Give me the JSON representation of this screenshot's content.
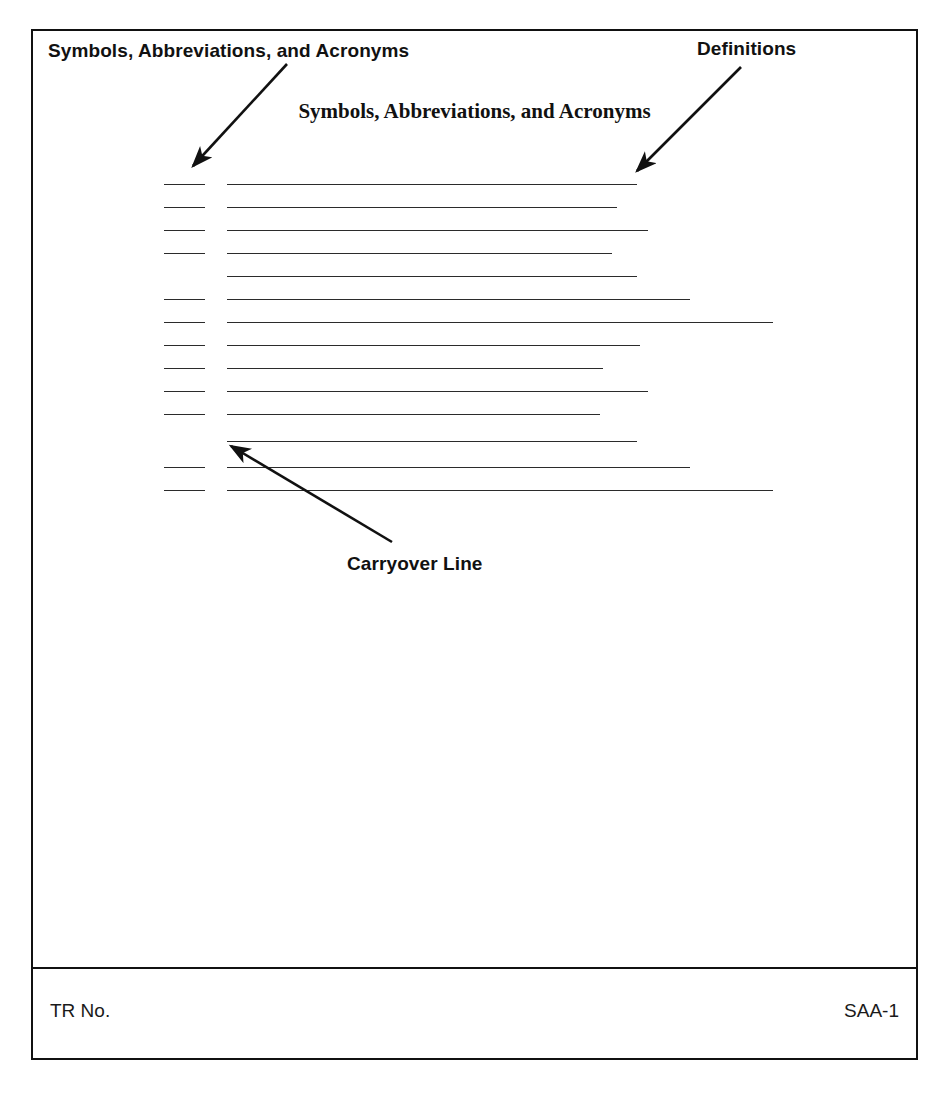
{
  "document": {
    "heading": "Symbols, Abbreviations, and Acronyms",
    "form_id": "SAA-1"
  },
  "callouts": {
    "symbols": {
      "label": "Symbols, Abbreviations, and Acronyms",
      "arrow": {
        "x1": 287,
        "y1": 64,
        "x2": 193,
        "y2": 166
      }
    },
    "definitions": {
      "label": "Definitions",
      "arrow": {
        "x1": 741,
        "y1": 67,
        "x2": 637,
        "y2": 171
      }
    },
    "carryover": {
      "label": "Carryover Line",
      "arrow": {
        "x1": 392,
        "y1": 542,
        "x2": 231,
        "y2": 446
      }
    }
  },
  "form_rows": [
    {
      "type": "entry",
      "y": 184,
      "symbol_x": 164,
      "symbol_x2": 205,
      "def_x": 227,
      "def_x2": 637
    },
    {
      "type": "entry",
      "y": 207,
      "symbol_x": 164,
      "symbol_x2": 205,
      "def_x": 227,
      "def_x2": 617
    },
    {
      "type": "entry",
      "y": 230,
      "symbol_x": 164,
      "symbol_x2": 205,
      "def_x": 227,
      "def_x2": 648
    },
    {
      "type": "entry",
      "y": 253,
      "symbol_x": 164,
      "symbol_x2": 205,
      "def_x": 227,
      "def_x2": 612
    },
    {
      "type": "carryover",
      "y": 276,
      "def_x": 227,
      "def_x2": 637
    },
    {
      "type": "entry",
      "y": 299,
      "symbol_x": 164,
      "symbol_x2": 205,
      "def_x": 227,
      "def_x2": 690
    },
    {
      "type": "entry",
      "y": 322,
      "symbol_x": 164,
      "symbol_x2": 205,
      "def_x": 227,
      "def_x2": 773
    },
    {
      "type": "entry",
      "y": 345,
      "symbol_x": 164,
      "symbol_x2": 205,
      "def_x": 227,
      "def_x2": 640
    },
    {
      "type": "entry",
      "y": 368,
      "symbol_x": 164,
      "symbol_x2": 205,
      "def_x": 227,
      "def_x2": 603
    },
    {
      "type": "entry",
      "y": 391,
      "symbol_x": 164,
      "symbol_x2": 205,
      "def_x": 227,
      "def_x2": 648
    },
    {
      "type": "entry",
      "y": 414,
      "symbol_x": 164,
      "symbol_x2": 205,
      "def_x": 227,
      "def_x2": 600
    },
    {
      "type": "carryover",
      "y": 441,
      "def_x": 227,
      "def_x2": 637
    },
    {
      "type": "entry",
      "y": 467,
      "symbol_x": 164,
      "symbol_x2": 205,
      "def_x": 227,
      "def_x2": 690
    },
    {
      "type": "entry",
      "y": 490,
      "symbol_x": 164,
      "symbol_x2": 205,
      "def_x": 227,
      "def_x2": 773
    }
  ],
  "footer": {
    "tr_no_label": "TR No.",
    "page_id": "SAA-1"
  },
  "colors": {
    "ink": "#111111",
    "rule": "#2b2b2b",
    "paper": "#ffffff"
  }
}
